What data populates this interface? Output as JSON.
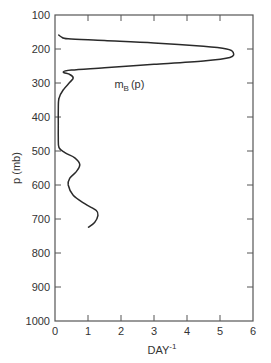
{
  "chart_data": {
    "type": "line",
    "title": "",
    "xlabel": "DAY",
    "xlabel_superscript": "-1",
    "ylabel": "p (mb)",
    "annotation": {
      "text": "m",
      "subscript": "B",
      "suffix": "(p)",
      "x": 1.8,
      "y": 315
    },
    "xlim": [
      0,
      6
    ],
    "ylim": [
      1000,
      100
    ],
    "y_inverted": true,
    "grid": false,
    "x_ticks": [
      0,
      1,
      2,
      3,
      4,
      5,
      6
    ],
    "y_ticks": [
      100,
      200,
      300,
      400,
      500,
      600,
      700,
      800,
      900,
      1000
    ],
    "series": [
      {
        "name": "m_B(p)",
        "points": [
          [
            0.1,
            158
          ],
          [
            0.2,
            165
          ],
          [
            0.4,
            170
          ],
          [
            1.5,
            175
          ],
          [
            3.0,
            182
          ],
          [
            4.5,
            192
          ],
          [
            5.2,
            200
          ],
          [
            5.4,
            210
          ],
          [
            5.3,
            225
          ],
          [
            4.5,
            235
          ],
          [
            3.0,
            245
          ],
          [
            1.5,
            255
          ],
          [
            0.5,
            262
          ],
          [
            0.25,
            268
          ],
          [
            0.45,
            275
          ],
          [
            0.55,
            285
          ],
          [
            0.45,
            298
          ],
          [
            0.25,
            320
          ],
          [
            0.12,
            345
          ],
          [
            0.1,
            380
          ],
          [
            0.1,
            420
          ],
          [
            0.1,
            460
          ],
          [
            0.12,
            490
          ],
          [
            0.3,
            505
          ],
          [
            0.6,
            520
          ],
          [
            0.75,
            540
          ],
          [
            0.65,
            560
          ],
          [
            0.45,
            580
          ],
          [
            0.4,
            600
          ],
          [
            0.55,
            630
          ],
          [
            0.9,
            655
          ],
          [
            1.25,
            675
          ],
          [
            1.3,
            690
          ],
          [
            1.2,
            710
          ],
          [
            1.0,
            725
          ]
        ]
      }
    ]
  }
}
